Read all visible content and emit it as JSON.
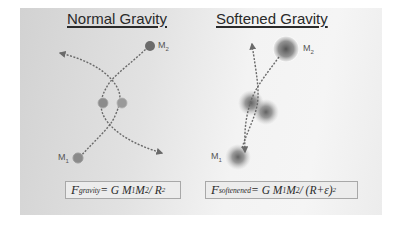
{
  "left_panel": {
    "title": "Normal Gravity",
    "m2_label": "M",
    "m2_sub": "2",
    "m1_label": "M",
    "m1_sub": "1",
    "formula": {
      "lhs": "F",
      "lhs_sub": "gravity",
      "rhs_pre": " = G M",
      "m1_sub": "1",
      "mid": " M",
      "m2_sub": "2",
      "rhs_post": " / R",
      "exp": "2"
    }
  },
  "right_panel": {
    "title": "Softened Gravity",
    "m2_label": "M",
    "m2_sub": "2",
    "m1_label": "M",
    "m1_sub": "1",
    "formula": {
      "lhs": "F",
      "lhs_sub": "softenened",
      "rhs_pre": " = G M",
      "m1_sub": "1",
      "mid": " M",
      "m2_sub": "2",
      "rhs_post": " / (R+ε)",
      "exp": "2"
    }
  },
  "colors": {
    "background": "#ffffff",
    "panel_dark": "#d2d2d2",
    "panel_light": "#f5f5f5",
    "mass_dark": "#6e6e6e",
    "path": "#6a6a6a",
    "text": "#2a2a2a"
  }
}
